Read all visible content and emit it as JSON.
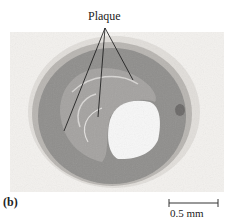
{
  "figure": {
    "panel_label": "(b)",
    "annotation": "Plaque",
    "scale_bar": {
      "label": "0.5 mm"
    },
    "colors": {
      "tissue": "#8f8f8f",
      "lumen": "#f7f7f7",
      "background": "#f3f1ee"
    }
  }
}
